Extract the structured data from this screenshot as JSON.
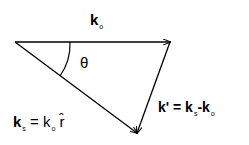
{
  "diagram": {
    "title_vector": {
      "symbol": "k",
      "subscript": "o"
    },
    "angle_label": "θ",
    "scattered": {
      "symbol": "k",
      "subscript": "s",
      "equals": "=",
      "rhs_symbol": "k",
      "rhs_subscript": "o",
      "rhs_unit": "r̂"
    },
    "transfer": {
      "symbol": "k'",
      "equals": "=",
      "a_symbol": "k",
      "a_subscript": "s",
      "minus": "-",
      "b_symbol": "k",
      "b_subscript": "o"
    }
  }
}
